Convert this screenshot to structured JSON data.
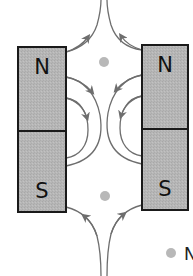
{
  "diagram": {
    "type": "magnetic-field-lines",
    "magnets": [
      {
        "id": "left",
        "top_pole": "N",
        "bottom_pole": "S"
      },
      {
        "id": "right",
        "top_pole": "N",
        "bottom_pole": "S"
      }
    ],
    "neutral_points": [
      {
        "id": "top-neutral-point"
      },
      {
        "id": "bottom-neutral-point"
      }
    ],
    "legend": {
      "marker": "gray dot",
      "label_partial": "N"
    },
    "colors": {
      "magnet_fill": "#b4b4b4",
      "magnet_border": "#1a1a1a",
      "field_line": "#6e6e6e",
      "neutral_point": "#b8b8b8",
      "background": "#ffffff"
    }
  }
}
